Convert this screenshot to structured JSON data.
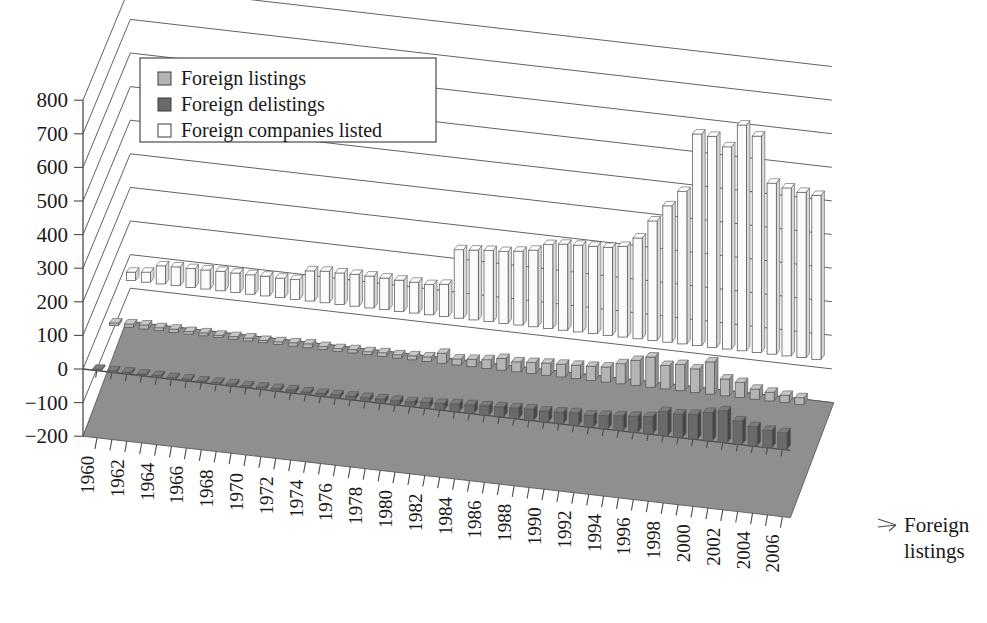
{
  "chart_data": {
    "type": "bar",
    "title": "",
    "subtitle": "",
    "xlabel": "",
    "ylabel": "",
    "depth_axis_label": "Foreign listings",
    "ylim": [
      -200,
      800
    ],
    "ytick_step": 100,
    "yticks": [
      "800",
      "700",
      "600",
      "500",
      "400",
      "300",
      "200",
      "100",
      "0",
      "−100",
      "−200"
    ],
    "ytick_values": [
      800,
      700,
      600,
      500,
      400,
      300,
      200,
      100,
      0,
      -100,
      -200
    ],
    "grid": true,
    "legend_position": "upper-left",
    "projection": "3d-columns",
    "categories": [
      1960,
      1961,
      1962,
      1963,
      1964,
      1965,
      1966,
      1967,
      1968,
      1969,
      1970,
      1971,
      1972,
      1973,
      1974,
      1975,
      1976,
      1977,
      1978,
      1979,
      1980,
      1981,
      1982,
      1983,
      1984,
      1985,
      1986,
      1987,
      1988,
      1989,
      1990,
      1991,
      1992,
      1993,
      1994,
      1995,
      1996,
      1997,
      1998,
      1999,
      2000,
      2001,
      2002,
      2003,
      2004,
      2005,
      2006
    ],
    "xtick_labels": [
      "1960",
      "",
      "1962",
      "",
      "1964",
      "",
      "1966",
      "",
      "1968",
      "",
      "1970",
      "",
      "1972",
      "",
      "1974",
      "",
      "1976",
      "",
      "1978",
      "",
      "1980",
      "",
      "1982",
      "",
      "1984",
      "",
      "1986",
      "",
      "1988",
      "",
      "1990",
      "",
      "1992",
      "",
      "1994",
      "",
      "1996",
      "",
      "1998",
      "",
      "2000",
      "",
      "2002",
      "",
      "2004",
      "",
      "2006"
    ],
    "series": [
      {
        "name": "Foreign listings",
        "color": "#b5b5b5",
        "values": [
          8,
          10,
          12,
          9,
          10,
          8,
          9,
          7,
          8,
          9,
          7,
          8,
          10,
          12,
          9,
          8,
          10,
          9,
          11,
          10,
          12,
          14,
          30,
          18,
          22,
          26,
          35,
          30,
          33,
          36,
          38,
          40,
          42,
          45,
          60,
          75,
          90,
          70,
          78,
          70,
          96,
          50,
          45,
          30,
          26,
          22,
          20
        ]
      },
      {
        "name": "Foreign delistings",
        "color": "#6a6a6a",
        "values": [
          4,
          5,
          6,
          5,
          6,
          5,
          6,
          5,
          6,
          7,
          6,
          7,
          8,
          9,
          8,
          9,
          10,
          11,
          12,
          13,
          14,
          15,
          18,
          20,
          24,
          26,
          28,
          30,
          32,
          34,
          33,
          35,
          38,
          36,
          40,
          44,
          48,
          52,
          72,
          70,
          74,
          85,
          95,
          70,
          58,
          52,
          50
        ]
      },
      {
        "name": "Foreign companies listed",
        "color": "#fbfbfb",
        "values": [
          25,
          30,
          54,
          56,
          56,
          57,
          58,
          58,
          58,
          59,
          58,
          59,
          90,
          94,
          94,
          95,
          95,
          94,
          93,
          92,
          90,
          96,
          204,
          208,
          212,
          214,
          220,
          228,
          250,
          256,
          258,
          260,
          262,
          270,
          300,
          356,
          406,
          454,
          630,
          628,
          602,
          672,
          644,
          509,
          500,
          492,
          488
        ]
      }
    ],
    "legend": [
      {
        "label": "Foreign listings",
        "swatch": "#b5b5b5",
        "style": "filled-light"
      },
      {
        "label": "Foreign delistings",
        "swatch": "#6a6a6a",
        "style": "filled-dark"
      },
      {
        "label": "Foreign companies listed",
        "swatch": "#ffffff",
        "style": "outlined"
      }
    ],
    "floor_color": "#8f8f8f"
  }
}
